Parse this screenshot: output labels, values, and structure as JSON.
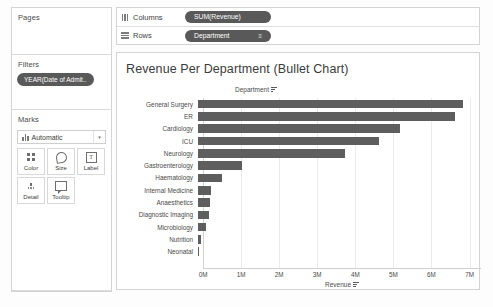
{
  "panels": {
    "pages": {
      "title": "Pages"
    },
    "filters": {
      "title": "Filters",
      "pill": "YEAR(Date of Admit.."
    },
    "marks": {
      "title": "Marks",
      "type_label": "Automatic",
      "type_icon": "bar-mark-icon",
      "caret": "▾",
      "buttons": [
        {
          "label": "Color",
          "icon": "color-icon"
        },
        {
          "label": "Size",
          "icon": "size-icon"
        },
        {
          "label": "Label",
          "icon": "label-icon"
        },
        {
          "label": "Detail",
          "icon": "detail-icon"
        },
        {
          "label": "Tooltip",
          "icon": "tooltip-icon"
        }
      ]
    }
  },
  "shelves": [
    {
      "name": "columns",
      "label": "Columns",
      "icon": "columns-icon",
      "pill": "SUM(Revenue)",
      "sort": ""
    },
    {
      "name": "rows",
      "label": "Rows",
      "icon": "rows-icon",
      "pill": "Department",
      "sort": "≡"
    }
  ],
  "viz": {
    "title": "Revenue Per Department (Bullet Chart)",
    "category_header": "Department",
    "category_sort_icon": "sort-descending-icon",
    "axis_sort_icon": "sort-descending-icon"
  },
  "caption": "",
  "colors": {
    "bar": "#5e5e5e",
    "pill": "#595959",
    "panel_border": "#d4d4d4",
    "gridline": "#ebebeb",
    "text": "#4a4a4a"
  },
  "chart_data": {
    "type": "bar",
    "orientation": "horizontal",
    "title": "Revenue Per Department (Bullet Chart)",
    "xlabel": "Revenue",
    "ylabel": "Department",
    "xlim": [
      0,
      7.3
    ],
    "units": "M",
    "grid": true,
    "legend": "none",
    "xticks": [
      "0M",
      "1M",
      "2M",
      "3M",
      "4M",
      "5M",
      "6M",
      "7M"
    ],
    "xtick_values": [
      0,
      1,
      2,
      3,
      4,
      5,
      6,
      7
    ],
    "categories": [
      "General Surgery",
      "ER",
      "Cardiology",
      "ICU",
      "Neurology",
      "Gastroenterology",
      "Haematology",
      "Internal Medicine",
      "Anaesthetics",
      "Diagnostic Imaging",
      "Microbiology",
      "Nutrition",
      "Neonatal"
    ],
    "values": [
      6.95,
      6.75,
      5.3,
      4.75,
      3.85,
      1.15,
      0.62,
      0.33,
      0.31,
      0.3,
      0.22,
      0.09,
      0.02
    ],
    "value_labels": [
      "6.95M",
      "6.75M",
      "5.30M",
      "4.75M",
      "3.85M",
      "1.15M",
      "0.62M",
      "0.33M",
      "0.31M",
      "0.30M",
      "0.22M",
      "0.09M",
      "0.02M"
    ]
  }
}
